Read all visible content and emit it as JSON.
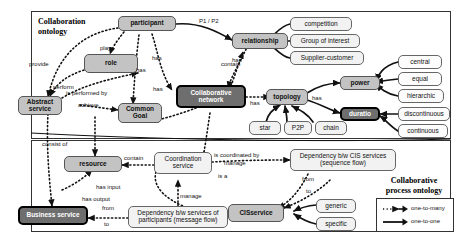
{
  "diagram": {
    "title_top": "Collaboration ontology",
    "title_bottom": "Collaborative process ontology",
    "regions": [
      {
        "id": "collaboration-ontology",
        "label": "Collaboration\nontology"
      },
      {
        "id": "collaborative-process-ontology",
        "label": "Collaborative\nprocess ontology"
      }
    ]
  },
  "titles": {
    "collaboration_ontology_line1": "Collaboration",
    "collaboration_ontology_line2": "ontology",
    "process_ontology_line1": "Collaborative",
    "process_ontology_line2": "process ontology"
  },
  "nodes": [
    {
      "id": "participant",
      "label": "participant",
      "style": "mid"
    },
    {
      "id": "role",
      "label": "role",
      "style": "mid"
    },
    {
      "id": "abstract-service",
      "label": "Abstract\nservice",
      "style": "mid"
    },
    {
      "id": "common-goal",
      "label": "Common\nGoal",
      "style": "mid"
    },
    {
      "id": "collaborative-network",
      "label": "Collaborative\nnetwork",
      "style": "dark"
    },
    {
      "id": "relationship",
      "label": "relationship",
      "style": "mid"
    },
    {
      "id": "competition",
      "label": "competition",
      "style": "light"
    },
    {
      "id": "group-of-interest",
      "label": "Group of interest",
      "style": "light"
    },
    {
      "id": "supplier-customer",
      "label": "Supplier-customer",
      "style": "light"
    },
    {
      "id": "topology",
      "label": "topology",
      "style": "mid"
    },
    {
      "id": "power",
      "label": "power",
      "style": "mid"
    },
    {
      "id": "duratio",
      "label": "duratio",
      "style": "dark"
    },
    {
      "id": "central",
      "label": "central",
      "style": "white"
    },
    {
      "id": "equal",
      "label": "equal",
      "style": "white"
    },
    {
      "id": "hierarchic",
      "label": "hierarchic",
      "style": "white"
    },
    {
      "id": "discontinuous",
      "label": "discontinuous",
      "style": "white"
    },
    {
      "id": "continuous",
      "label": "continuous",
      "style": "white"
    },
    {
      "id": "star",
      "label": "star",
      "style": "light"
    },
    {
      "id": "p2p",
      "label": "P2P",
      "style": "light"
    },
    {
      "id": "chain",
      "label": "chain",
      "style": "light"
    },
    {
      "id": "resource",
      "label": "resource",
      "style": "mid"
    },
    {
      "id": "coordination-service",
      "label": "Coordination\nservice",
      "style": "light"
    },
    {
      "id": "business-service",
      "label": "Business service",
      "style": "dark"
    },
    {
      "id": "dependency-participants",
      "label": "Dependency b/w services of\nparticipants (message flow)",
      "style": "light"
    },
    {
      "id": "dependency-cis",
      "label": "Dependency b/w CIS services\n(sequence flow)",
      "style": "light"
    },
    {
      "id": "cis-service",
      "label": "CISservice",
      "style": "mid"
    },
    {
      "id": "generic",
      "label": "generic",
      "style": "light"
    },
    {
      "id": "specific",
      "label": "specific",
      "style": "light"
    }
  ],
  "edge_labels": [
    {
      "id": "provide",
      "text": "provide"
    },
    {
      "id": "play",
      "text": "play"
    },
    {
      "id": "perform",
      "text": "perform"
    },
    {
      "id": "is-performed-by",
      "text": "is performed by"
    },
    {
      "id": "achieve",
      "text": "achieve"
    },
    {
      "id": "has-participant-goal",
      "text": "has"
    },
    {
      "id": "has-participant-net",
      "text": "has"
    },
    {
      "id": "has-network-goal",
      "text": "has"
    },
    {
      "id": "has-network-right",
      "text": "has"
    },
    {
      "id": "p1-p2",
      "text": "P1 / P2"
    },
    {
      "id": "contain-relationship",
      "text": "contain"
    },
    {
      "id": "has-topology",
      "text": "has"
    },
    {
      "id": "has-power",
      "text": "has"
    },
    {
      "id": "consist-of",
      "text": "consist of"
    },
    {
      "id": "contain-resource",
      "text": "contain"
    },
    {
      "id": "has-input",
      "text": "has input"
    },
    {
      "id": "has-output",
      "text": "has output"
    },
    {
      "id": "from-left",
      "text": "from"
    },
    {
      "id": "to-left",
      "text": "to"
    },
    {
      "id": "manage-left",
      "text": "manage"
    },
    {
      "id": "is-coordinated-by",
      "text": "is coordinated by"
    },
    {
      "id": "manage-right",
      "text": "manage"
    },
    {
      "id": "is-a",
      "text": "is a"
    },
    {
      "id": "from-right",
      "text": "from"
    },
    {
      "id": "to-right",
      "text": "to"
    }
  ],
  "legend": {
    "items": [
      {
        "id": "one-to-many",
        "label": "one-to-many",
        "line": "dotted"
      },
      {
        "id": "one-to-one",
        "label": "one-to-one",
        "line": "solid"
      }
    ]
  },
  "colors": {
    "dark_fill": "#6e6e6e",
    "mid_fill": "#c3c3c3",
    "light_fill": "#f2f2f2",
    "white_fill": "#fcfcfc",
    "stroke": "#111111"
  }
}
